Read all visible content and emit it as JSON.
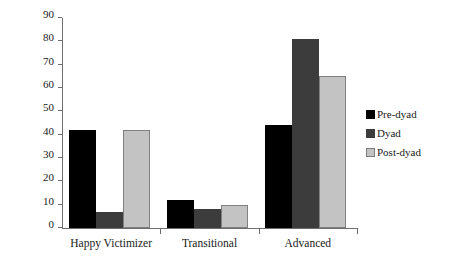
{
  "chart_data": {
    "type": "bar",
    "title": "",
    "subtitle": "",
    "xlabel": "",
    "ylabel": "",
    "categories": [
      "Happy Victimizer",
      "Transitional",
      "Advanced"
    ],
    "series": [
      {
        "name": "Pre-dyad",
        "color": "#000000",
        "values": [
          42,
          12,
          44
        ]
      },
      {
        "name": "Dyad",
        "color": "#3c3c3c",
        "values": [
          7,
          8,
          81
        ]
      },
      {
        "name": "Post-dyad",
        "color": "#c3c3c3",
        "values": [
          42,
          10,
          65
        ]
      }
    ],
    "ylim": [
      0,
      90
    ],
    "ytick_step": 10,
    "yticks": [
      0,
      10,
      20,
      30,
      40,
      50,
      60,
      70,
      80,
      90
    ],
    "ytick_labels": [
      "0",
      "10",
      "20",
      "30",
      "40",
      "50",
      "60",
      "70",
      "80",
      "90"
    ],
    "grid": false,
    "legend_position": "right",
    "bar_gap_within_group": 0,
    "axis_color": "#6d6d6d"
  },
  "legend": {
    "entries": [
      {
        "label": "Pre-dyad"
      },
      {
        "label": "Dyad"
      },
      {
        "label": "Post-dyad"
      }
    ]
  }
}
